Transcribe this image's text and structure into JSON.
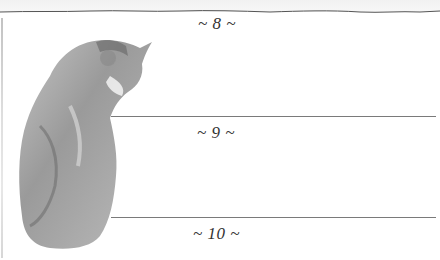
{
  "page": {
    "sections": [
      {
        "label": "~ 8 ~"
      },
      {
        "label": "~ 9 ~"
      },
      {
        "label": "~ 10 ~"
      }
    ],
    "illustration": "tabby-cat-sitting-back-view",
    "colors": {
      "background": "#ffffff",
      "rule": "#7a7a7a",
      "text": "#333333"
    }
  }
}
